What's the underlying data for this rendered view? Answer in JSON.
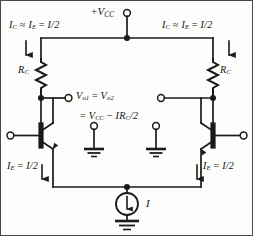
{
  "diagram": {
    "supply": {
      "label_prefix": "+",
      "label_symbol": "V",
      "label_sub": "CC",
      "terminal": "open-terminal"
    },
    "left_branch": {
      "collector_current_label": "I",
      "collector_current_sub": "C",
      "approx_symbol": "≈",
      "emitter_current_label": "I",
      "emitter_current_sub": "E",
      "equals": "=",
      "value": "I/2",
      "resistor_label": "R",
      "resistor_sub": "C",
      "emitter_label": "I",
      "emitter_sub": "E",
      "emitter_value": "I/2"
    },
    "right_branch": {
      "collector_current_label": "I",
      "collector_current_sub": "C",
      "approx_symbol": "≈",
      "emitter_current_label": "I",
      "emitter_current_sub": "E",
      "equals": "=",
      "value": "I/2",
      "resistor_label": "R",
      "resistor_sub": "C",
      "emitter_label": "I",
      "emitter_sub": "E",
      "emitter_value": "I/2"
    },
    "output": {
      "line1_v1": "V",
      "line1_v1_sub": "o1",
      "line1_equals": "=",
      "line1_v2": "V",
      "line1_v2_sub": "o2",
      "line2_equals": "=",
      "line2_vcc": "V",
      "line2_vcc_sub": "CC",
      "line2_minus": "−",
      "line2_term": "IR",
      "line2_term_sub": "C",
      "line2_div": "/2"
    },
    "current_source": {
      "label": "I",
      "direction": "down"
    },
    "colors": {
      "wire": "#1a1a18",
      "text": "#15130f",
      "background": "#fdfdfb",
      "border": "#4a4a48"
    },
    "icons": {
      "ground": "ground-icon",
      "npn_transistor": "npn-transistor-icon",
      "resistor": "resistor-icon",
      "current_source": "current-source-icon",
      "junction": "junction-dot-icon",
      "terminal": "open-terminal-icon",
      "arrow_down": "arrow-down-icon"
    }
  }
}
